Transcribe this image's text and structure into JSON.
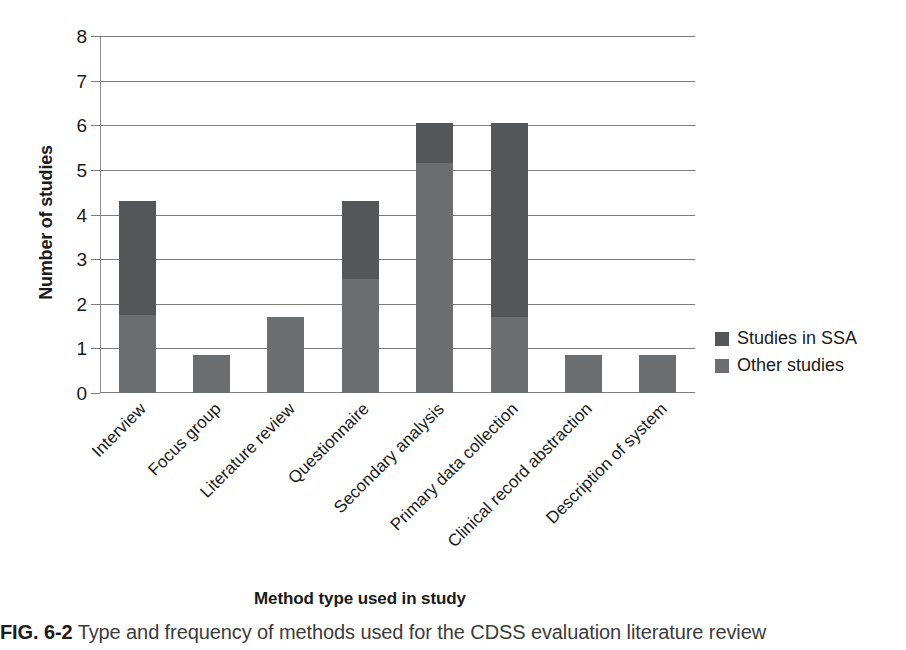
{
  "chart_data": {
    "type": "bar",
    "subtype": "stacked-vertical",
    "title": "",
    "xlabel": "Method type used in study",
    "ylabel": "Number of studies",
    "ylim": [
      0,
      8
    ],
    "yticks": [
      0,
      1,
      2,
      3,
      4,
      5,
      6,
      7,
      8
    ],
    "ytick_labels": [
      "0",
      "1",
      "2",
      "3",
      "4",
      "5",
      "6",
      "7",
      "8"
    ],
    "grid": "horizontal",
    "legend_position": "right",
    "categories": [
      "Interview",
      "Focus group",
      "Literature review",
      "Questionnaire",
      "Secondary analysis",
      "Primary data collection",
      "Clinical record abstraction",
      "Description of system"
    ],
    "series": [
      {
        "name": "Other studies",
        "color": "#6b6e70",
        "values": [
          1.75,
          0.85,
          1.7,
          2.55,
          5.15,
          1.7,
          0.85,
          0.85
        ]
      },
      {
        "name": "Studies in SSA",
        "color": "#545759",
        "values": [
          2.55,
          0,
          0,
          1.75,
          0.9,
          4.35,
          0,
          0
        ]
      }
    ],
    "totals": [
      4.3,
      0.85,
      1.7,
      4.3,
      6.05,
      6.05,
      0.85,
      0.85
    ]
  },
  "legend": {
    "items": [
      {
        "label": "Studies in SSA",
        "color": "#545759"
      },
      {
        "label": "Other studies",
        "color": "#6b6e70"
      }
    ]
  },
  "caption": {
    "number": "FIG. 6-2",
    "text": "Type and frequency of methods used for the CDSS evaluation literature review"
  }
}
